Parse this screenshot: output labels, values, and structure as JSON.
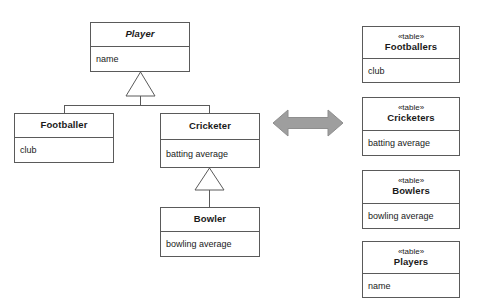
{
  "diagram": {
    "colors": {
      "line": "#5a5a5a",
      "text": "#1a1a1a",
      "background": "#ffffff",
      "arrow_fill": "#9e9e9e",
      "arrow_stroke": "#8a8a8a"
    }
  },
  "classes": {
    "player": {
      "name": "Player",
      "attribute": "name",
      "abstract": true
    },
    "footballer": {
      "name": "Footballer",
      "attribute": "club",
      "abstract": false
    },
    "cricketer": {
      "name": "Cricketer",
      "attribute": "batting average",
      "abstract": false
    },
    "bowler": {
      "name": "Bowler",
      "attribute": "bowling average",
      "abstract": false
    }
  },
  "tables": [
    {
      "stereotype": "«table»",
      "name": "Footballers",
      "column": "club"
    },
    {
      "stereotype": "«table»",
      "name": "Cricketers",
      "column": "batting average"
    },
    {
      "stereotype": "«table»",
      "name": "Bowlers",
      "column": "bowling average"
    },
    {
      "stereotype": "«table»",
      "name": "Players",
      "column": "name"
    }
  ],
  "relationships": {
    "generalizations": [
      {
        "child": "Footballer",
        "parent": "Player"
      },
      {
        "child": "Cricketer",
        "parent": "Player"
      },
      {
        "child": "Bowler",
        "parent": "Cricketer"
      }
    ],
    "mapping_arrow": {
      "label": "",
      "direction": "bidirectional"
    }
  }
}
